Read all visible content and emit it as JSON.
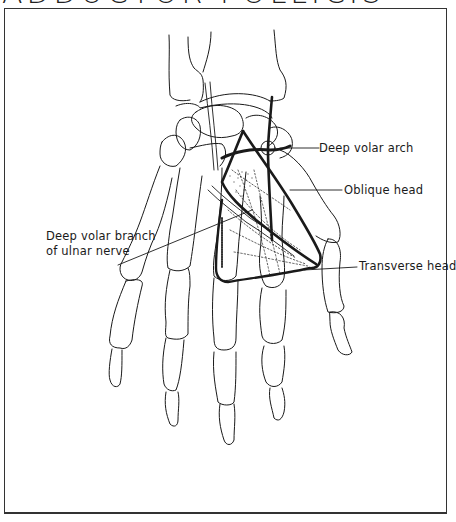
{
  "figure": {
    "title": "ADDUCTOR POLLICIS",
    "labels": {
      "deep_volar_arch": "Deep volar arch",
      "oblique_head": "Oblique head",
      "deep_volar_branch_line1": "Deep volar branch",
      "deep_volar_branch_line2": "of ulnar nerve",
      "transverse_head": "Transverse head"
    },
    "colors": {
      "line": "#1a1a1a",
      "background": "#ffffff"
    }
  }
}
